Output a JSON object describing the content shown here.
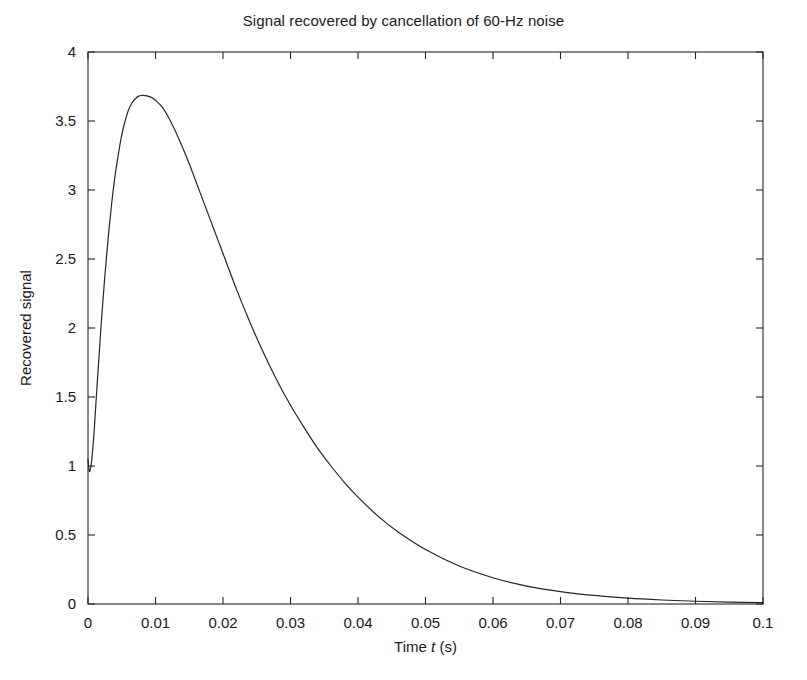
{
  "chart_data": {
    "type": "line",
    "title": "Signal recovered by cancellation of 60-Hz noise",
    "xlabel": "Time t (s)",
    "xlabel_plain": "Time",
    "xlabel_var": "t",
    "xlabel_unit": "(s)",
    "ylabel": "Recovered signal",
    "xlim": [
      0,
      0.1
    ],
    "ylim": [
      0,
      4
    ],
    "grid": false,
    "legend": null,
    "line_color": "#262626",
    "line_width": 1.2,
    "axis_color": "#262626",
    "background": "#ffffff",
    "xticks": [
      0,
      0.01,
      0.02,
      0.03,
      0.04,
      0.05,
      0.06,
      0.07,
      0.08,
      0.09,
      0.1
    ],
    "xticklabels": [
      "0",
      "0.01",
      "0.02",
      "0.03",
      "0.04",
      "0.05",
      "0.06",
      "0.07",
      "0.08",
      "0.09",
      "0.1"
    ],
    "yticks": [
      0,
      0.5,
      1,
      1.5,
      2,
      2.5,
      3,
      3.5,
      4
    ],
    "yticklabels": [
      "0",
      "0.5",
      "1",
      "1.5",
      "2",
      "2.5",
      "3",
      "3.5",
      "4"
    ],
    "series": [
      {
        "name": "Recovered signal",
        "x": [
          0.0,
          0.0002,
          0.0005,
          0.0008,
          0.001,
          0.0015,
          0.002,
          0.0025,
          0.003,
          0.0035,
          0.004,
          0.0045,
          0.005,
          0.0055,
          0.006,
          0.0065,
          0.007,
          0.0075,
          0.008,
          0.0085,
          0.009,
          0.0095,
          0.01,
          0.011,
          0.012,
          0.013,
          0.014,
          0.015,
          0.016,
          0.017,
          0.018,
          0.019,
          0.02,
          0.022,
          0.024,
          0.026,
          0.028,
          0.03,
          0.032,
          0.034,
          0.036,
          0.038,
          0.04,
          0.043,
          0.046,
          0.05,
          0.055,
          0.06,
          0.065,
          0.07,
          0.075,
          0.08,
          0.085,
          0.09,
          0.095,
          0.1
        ],
        "y": [
          1.05,
          0.96,
          1.02,
          1.18,
          1.32,
          1.7,
          2.06,
          2.38,
          2.66,
          2.9,
          3.1,
          3.26,
          3.4,
          3.5,
          3.58,
          3.63,
          3.66,
          3.68,
          3.685,
          3.684,
          3.678,
          3.668,
          3.65,
          3.6,
          3.52,
          3.42,
          3.31,
          3.19,
          3.06,
          2.93,
          2.8,
          2.67,
          2.54,
          2.28,
          2.04,
          1.82,
          1.62,
          1.44,
          1.28,
          1.13,
          1.0,
          0.88,
          0.775,
          0.635,
          0.52,
          0.395,
          0.275,
          0.19,
          0.13,
          0.09,
          0.062,
          0.042,
          0.029,
          0.02,
          0.014,
          0.01
        ]
      }
    ],
    "peak": {
      "x": 0.0085,
      "y": 3.685
    },
    "start_value": 1.05,
    "end_value": 0.01
  }
}
